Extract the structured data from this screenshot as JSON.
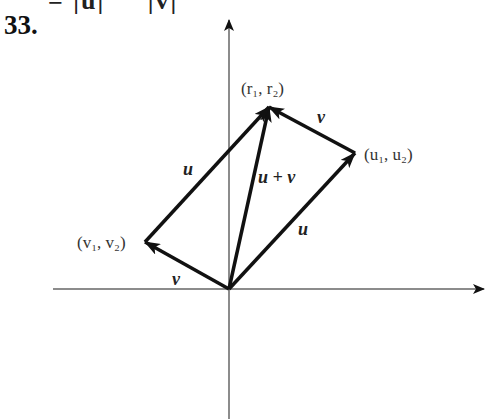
{
  "header": {
    "top_fragment": "= |u|     |v|",
    "problem_number": "33."
  },
  "diagram": {
    "origin": [
      229,
      289
    ],
    "axes": {
      "x": {
        "from": [
          53,
          289
        ],
        "to": [
          484,
          289
        ]
      },
      "y": {
        "from": [
          229,
          419
        ],
        "to": [
          229,
          20
        ]
      }
    },
    "points": {
      "r": {
        "label": "(r₁, r₂)",
        "pos": [
          269,
          107
        ]
      },
      "u": {
        "label": "(u₁, u₂)",
        "pos": [
          355,
          153
        ]
      },
      "v": {
        "label": "(v₁, v₂)",
        "pos": [
          145,
          242
        ]
      }
    },
    "vector_labels": {
      "u_upper": "u",
      "u_lower": "u",
      "v_upper": "v",
      "v_lower": "v",
      "sum": "u + v"
    },
    "colors": {
      "vector": "#111111",
      "axis": "#555555",
      "text": "#333333"
    }
  }
}
